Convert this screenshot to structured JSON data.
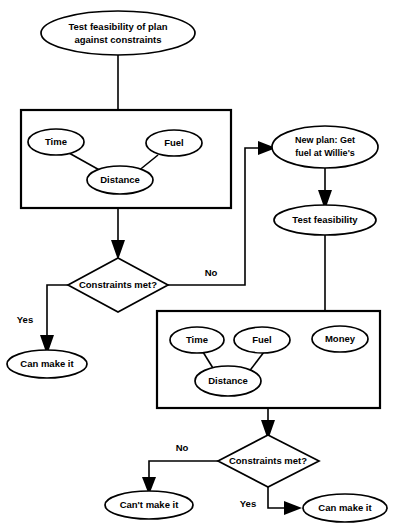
{
  "diagram": {
    "title_node": {
      "id": "test-feasibility-plan",
      "label_line1": "Test feasibility of plan",
      "label_line2": "against constraints"
    },
    "group_box_1": {
      "name": "constraints-group-1",
      "nodes": [
        {
          "id": "time-1",
          "label": "Time"
        },
        {
          "id": "fuel-1",
          "label": "Fuel"
        },
        {
          "id": "distance-1",
          "label": "Distance"
        }
      ]
    },
    "group_box_2": {
      "name": "constraints-group-2",
      "nodes": [
        {
          "id": "time-2",
          "label": "Time"
        },
        {
          "id": "fuel-2",
          "label": "Fuel"
        },
        {
          "id": "money-2",
          "label": "Money"
        },
        {
          "id": "distance-2",
          "label": "Distance"
        }
      ]
    },
    "decision_1": {
      "id": "constraints-met-1",
      "label": "Constraints met?"
    },
    "decision_2": {
      "id": "constraints-met-2",
      "label": "Constraints met?"
    },
    "new_plan": {
      "id": "new-plan",
      "label_line1": "New plan:  Get",
      "label_line2": "fuel at Willie's"
    },
    "test_feasibility": {
      "id": "test-feasibility",
      "label": "Test feasibility"
    },
    "outcome_yes_1": {
      "id": "can-make-it-1",
      "label": "Can make it"
    },
    "outcome_no_2": {
      "id": "cant-make-it",
      "label": "Can't make it"
    },
    "outcome_yes_2": {
      "id": "can-make-it-2",
      "label": "Can make it"
    },
    "edge_labels": {
      "d1_no": "No",
      "d1_yes": "Yes",
      "d2_no": "No",
      "d2_yes": "Yes"
    },
    "colors": {
      "stroke": "#000000",
      "fill": "#ffffff",
      "background": "#ffffff"
    }
  }
}
